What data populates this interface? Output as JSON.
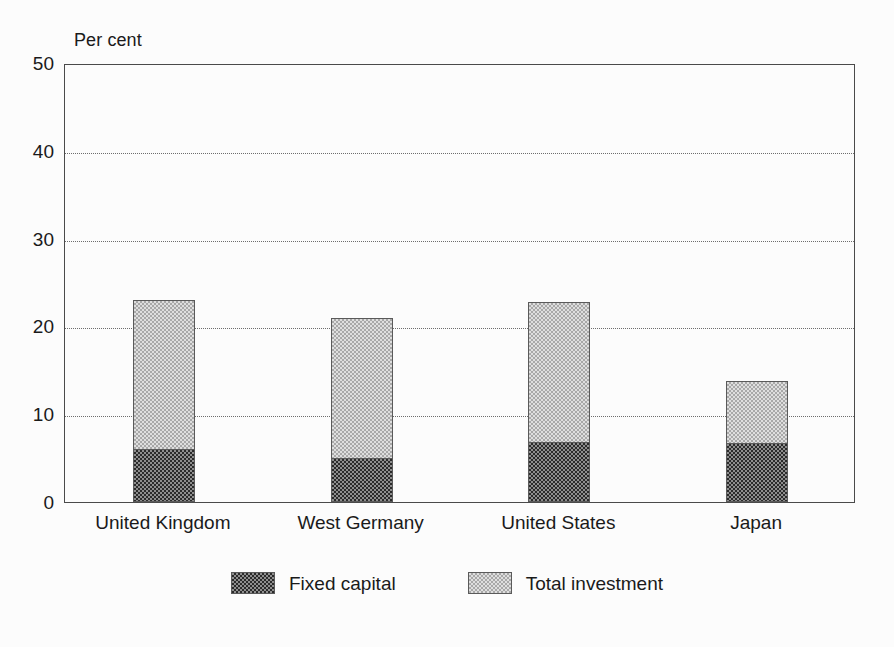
{
  "chart_data": {
    "type": "bar",
    "stacked": false,
    "overlay": true,
    "title": "",
    "subtitle": "",
    "unit_label": "Per cent",
    "xlabel": "",
    "ylabel": "Per cent",
    "ylim": [
      0,
      50
    ],
    "yticks": [
      0,
      10,
      20,
      30,
      40,
      50
    ],
    "ytick_labels": [
      "0",
      "10",
      "20",
      "30",
      "40",
      "50"
    ],
    "grid": "horizontal-dotted",
    "gridlines_at": [
      10,
      20,
      30,
      40
    ],
    "legend_position": "bottom-center",
    "categories": [
      "United Kingdom",
      "West Germany",
      "United States",
      "Japan"
    ],
    "series": [
      {
        "name": "Total investment",
        "color": "#dedede",
        "values": [
          23.0,
          21.0,
          22.8,
          13.8
        ]
      },
      {
        "name": "Fixed capital",
        "color": "#2b2b2b",
        "values": [
          6.0,
          5.0,
          6.8,
          6.7
        ]
      }
    ]
  },
  "legend": {
    "items": [
      {
        "label": "Fixed capital",
        "pattern": "dark-checker"
      },
      {
        "label": "Total investment",
        "pattern": "light-checker"
      }
    ]
  }
}
